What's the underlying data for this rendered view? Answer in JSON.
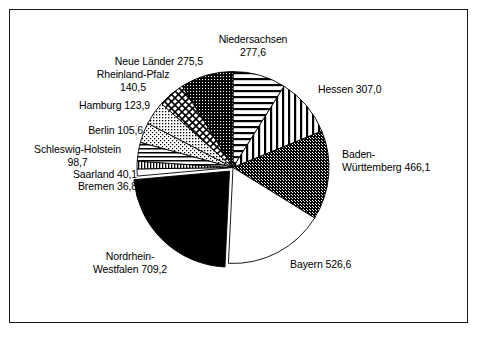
{
  "chart_data": {
    "type": "pie",
    "title": "",
    "subtitle": "",
    "xlabel": "",
    "ylabel": "",
    "legend_position": "none",
    "grid": false,
    "decimal_separator": ",",
    "total": "3007,6",
    "start_angle_deg": 0,
    "direction": "clockwise",
    "categories": [
      "Niedersachsen",
      "Hessen",
      "Baden-Württemberg",
      "Bayern",
      "Nordrhein-Westfalen",
      "Bremen",
      "Saarland",
      "Schleswig-Holstein",
      "Berlin",
      "Hamburg",
      "Rheinland-Pfalz",
      "Neue Länder"
    ],
    "values": [
      277.6,
      307.0,
      466.1,
      526.6,
      709.2,
      36.8,
      40.1,
      98.7,
      105.6,
      123.9,
      140.5,
      275.5
    ],
    "value_labels": [
      "277,6",
      "307,0",
      "466,1",
      "526,6",
      "709,2",
      "36,8",
      "40,1",
      "98,7",
      "105,6",
      "123,9",
      "140,5",
      "275,5"
    ],
    "slices": [
      {
        "name": "Niedersachsen",
        "value": 277.6,
        "value_label": "277,6",
        "pattern": "horizontal-lines",
        "exploded": false
      },
      {
        "name": "Hessen",
        "value": 307.0,
        "value_label": "307,0",
        "pattern": "vertical-lines",
        "exploded": false
      },
      {
        "name": "Baden-Württemberg",
        "value": 466.1,
        "value_label": "466,1",
        "pattern": "dark-stipple",
        "exploded": false
      },
      {
        "name": "Bayern",
        "value": 526.6,
        "value_label": "526,6",
        "pattern": "white",
        "exploded": false
      },
      {
        "name": "Nordrhein-Westfalen",
        "value": 709.2,
        "value_label": "709,2",
        "pattern": "solid-black",
        "exploded": true
      },
      {
        "name": "Bremen",
        "value": 36.8,
        "value_label": "36,8",
        "pattern": "white",
        "exploded": false
      },
      {
        "name": "Saarland",
        "value": 40.1,
        "value_label": "40,1",
        "pattern": "fine-vertical-lines",
        "exploded": false
      },
      {
        "name": "Schleswig-Holstein",
        "value": 98.7,
        "value_label": "98,7",
        "pattern": "horizontal-lines-sparse",
        "exploded": false
      },
      {
        "name": "Berlin",
        "value": 105.6,
        "value_label": "105,6",
        "pattern": "light-stipple",
        "exploded": false
      },
      {
        "name": "Hamburg",
        "value": 123.9,
        "value_label": "123,9",
        "pattern": "light-stipple-2",
        "exploded": false
      },
      {
        "name": "Rheinland-Pfalz",
        "value": 140.5,
        "value_label": "140,5",
        "pattern": "crosshatch",
        "exploded": false
      },
      {
        "name": "Neue Länder",
        "value": 275.5,
        "value_label": "275,5",
        "pattern": "dark-stipple-2",
        "exploded": false
      }
    ]
  },
  "labels": {
    "niedersachsen_name": "Niedersachsen",
    "niedersachsen_value": "277,6",
    "hessen": "Hessen 307,0",
    "baden_wuerttemberg_line1": "Baden-",
    "baden_wuerttemberg_line2": "Württemberg 466,1",
    "bayern": "Bayern 526,6",
    "nordrhein_line1": "Nordrhein-",
    "nordrhein_line2": "Westfalen 709,2",
    "bremen": "Bremen 36,8",
    "saarland": "Saarland 40,1",
    "schleswig_line1": "Schleswig-Holstein",
    "schleswig_line2": "98,7",
    "berlin": "Berlin 105,6",
    "hamburg": "Hamburg 123,9",
    "neue_laender": "Neue Länder 275,5",
    "rheinland_line1": "Rheinland-Pfalz",
    "rheinland_line2": "140,5"
  },
  "colors": {
    "background": "#ffffff",
    "border": "#1a1a1a",
    "text": "#000000",
    "slice_black": "#000000",
    "slice_white": "#ffffff",
    "slice_outline": "#000000"
  }
}
